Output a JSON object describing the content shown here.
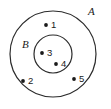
{
  "diagram": {
    "type": "venn-set-diagram",
    "title": "",
    "background_color": "#ffffff",
    "stroke_color": "#2b2b2b",
    "dot_color": "#1a1a1a",
    "sets": [
      {
        "name": "A",
        "label": "A",
        "role": "outer-set",
        "cx": 53,
        "cy": 54,
        "r": 43,
        "label_x": 88,
        "label_y": 12
      },
      {
        "name": "B",
        "label": "B",
        "role": "inner-subset",
        "cx": 53,
        "cy": 54,
        "r": 19,
        "label_x": 22,
        "label_y": 45
      }
    ],
    "points": [
      {
        "label": "1",
        "dot_x": 46,
        "dot_y": 25,
        "label_x": 51,
        "label_y": 25,
        "membership": "A only"
      },
      {
        "label": "2",
        "dot_x": 23,
        "dot_y": 81,
        "label_x": 28,
        "label_y": 81,
        "membership": "A only"
      },
      {
        "label": "3",
        "dot_x": 42,
        "dot_y": 53,
        "label_x": 47,
        "label_y": 53,
        "membership": "A and B"
      },
      {
        "label": "4",
        "dot_x": 56,
        "dot_y": 64,
        "label_x": 61,
        "label_y": 64,
        "membership": "A and B"
      },
      {
        "label": "5",
        "dot_x": 74,
        "dot_y": 79,
        "label_x": 79,
        "label_y": 79,
        "membership": "A only"
      }
    ]
  }
}
